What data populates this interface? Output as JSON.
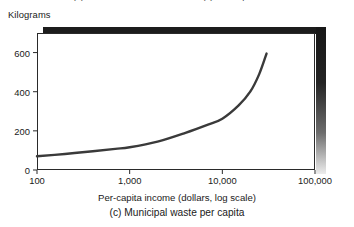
{
  "clipped_header": {
    "text": "(b) Sulfur dioxide concentration (c) Municipal waste"
  },
  "chart_data": {
    "type": "line",
    "title": "",
    "caption": "(c) Municipal waste per capita",
    "xlabel": "Per-capita income (dollars, log scale)",
    "ylabel": "Kilograms",
    "ylabel_position": "above-axis",
    "xscale": "log",
    "yscale": "linear",
    "xlim": [
      100,
      100000
    ],
    "ylim": [
      0,
      700
    ],
    "grid": false,
    "legend": null,
    "xticks": [
      100,
      1000,
      10000,
      100000
    ],
    "xtick_labels": [
      "100",
      "1,000",
      "10,000",
      "100,000"
    ],
    "yticks": [
      0,
      200,
      400,
      600
    ],
    "ytick_labels": [
      "0",
      "200",
      "400",
      "600"
    ],
    "series": [
      {
        "name": "Municipal waste per capita",
        "color": "#3a3a3a",
        "linewidth": 2.4,
        "x": [
          100,
          200,
          400,
          700,
          1000,
          2000,
          4000,
          7000,
          10000,
          15000,
          20000,
          25000,
          30000
        ],
        "y": [
          70,
          82,
          96,
          108,
          116,
          145,
          190,
          232,
          262,
          330,
          400,
          490,
          595
        ]
      }
    ]
  }
}
